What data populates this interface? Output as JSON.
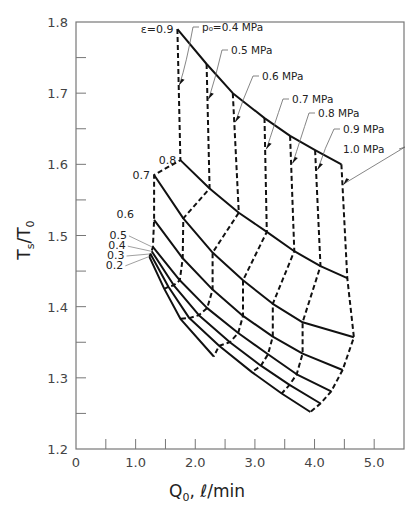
{
  "chart_data": {
    "type": "line",
    "title": "",
    "xlabel": "Q₀, ℓ/min",
    "ylabel": "Tₛ/T₀",
    "xlim": [
      0,
      5.5
    ],
    "ylim": [
      1.2,
      1.8
    ],
    "x_ticks": [
      "0",
      "1.0",
      "2.0",
      "3.0",
      "4.0",
      "5.0"
    ],
    "y_ticks": [
      "1.2",
      "1.3",
      "1.4",
      "1.5",
      "1.6",
      "1.7",
      "1.8"
    ],
    "grid": false,
    "pressure_levels_MPa": [
      0.4,
      0.5,
      0.6,
      0.7,
      0.8,
      0.9,
      1.0
    ],
    "series": [
      {
        "name": "ε=0.9",
        "label": "ε=0.9",
        "points": [
          [
            1.7,
            1.79
          ],
          [
            2.19,
            1.741
          ],
          [
            2.63,
            1.7
          ],
          [
            3.16,
            1.665
          ],
          [
            3.59,
            1.64
          ],
          [
            4.01,
            1.62
          ],
          [
            4.45,
            1.6
          ]
        ]
      },
      {
        "name": "ε=0.8",
        "label": "0.8",
        "points": [
          [
            1.75,
            1.606
          ],
          [
            2.24,
            1.566
          ],
          [
            2.73,
            1.532
          ],
          [
            3.2,
            1.505
          ],
          [
            3.66,
            1.478
          ],
          [
            4.1,
            1.457
          ],
          [
            4.55,
            1.44
          ]
        ]
      },
      {
        "name": "ε=0.7",
        "label": "0.7",
        "points": [
          [
            1.31,
            1.585
          ],
          [
            1.8,
            1.524
          ],
          [
            2.29,
            1.476
          ],
          [
            2.8,
            1.437
          ],
          [
            3.3,
            1.404
          ],
          [
            3.8,
            1.378
          ],
          [
            4.66,
            1.357
          ]
        ]
      },
      {
        "name": "ε=0.6",
        "label": "0.6",
        "points": [
          [
            1.31,
            1.522
          ],
          [
            1.79,
            1.468
          ],
          [
            2.29,
            1.424
          ],
          [
            2.8,
            1.387
          ],
          [
            3.3,
            1.358
          ],
          [
            3.8,
            1.334
          ],
          [
            4.47,
            1.311
          ]
        ]
      },
      {
        "name": "ε=0.5",
        "label": "0.5",
        "points": [
          [
            1.29,
            1.484
          ],
          [
            1.74,
            1.437
          ],
          [
            2.2,
            1.398
          ],
          [
            2.72,
            1.363
          ],
          [
            3.22,
            1.333
          ],
          [
            3.7,
            1.305
          ],
          [
            4.28,
            1.281
          ]
        ]
      },
      {
        "name": "ε=0.4",
        "label": "0.4",
        "points": [
          [
            1.27,
            1.478
          ],
          [
            1.64,
            1.43
          ],
          [
            2.06,
            1.388
          ],
          [
            2.58,
            1.35
          ],
          [
            3.1,
            1.317
          ],
          [
            3.58,
            1.29
          ],
          [
            4.1,
            1.264
          ]
        ]
      },
      {
        "name": "ε=0.3",
        "label": "0.3",
        "points": [
          [
            1.25,
            1.474
          ],
          [
            1.55,
            1.428
          ],
          [
            1.9,
            1.384
          ],
          [
            2.4,
            1.345
          ],
          [
            2.95,
            1.308
          ],
          [
            3.45,
            1.278
          ],
          [
            3.93,
            1.252
          ]
        ]
      },
      {
        "name": "ε=0.2",
        "label": "0.2",
        "points": [
          [
            1.23,
            1.47
          ],
          [
            1.48,
            1.425
          ],
          [
            1.75,
            1.383
          ],
          [
            2.31,
            1.33
          ]
        ]
      }
    ],
    "annotations": [
      {
        "text": "ε=0.9",
        "target": [
          1.7,
          1.79
        ]
      },
      {
        "text": "p₀=0.4 MPa",
        "target": [
          1.72,
          1.712
        ]
      },
      {
        "text": "0.5 MPa",
        "target": [
          2.21,
          1.692
        ]
      },
      {
        "text": "0.6 MPa",
        "target": [
          2.66,
          1.66
        ]
      },
      {
        "text": "0.7 MPa",
        "target": [
          3.18,
          1.622
        ]
      },
      {
        "text": "0.8 MPa",
        "target": [
          3.62,
          1.602
        ]
      },
      {
        "text": "0.9 MPa",
        "target": [
          4.04,
          1.593
        ]
      },
      {
        "text": "1.0 MPa",
        "target": [
          4.48,
          1.572
        ]
      }
    ]
  },
  "axes": {
    "x_title_main": "Q",
    "x_title_sub": "0",
    "x_title_rest": ", ℓ/min",
    "y_title_main": "T",
    "y_title_sub1": "s",
    "y_title_sep": "/T",
    "y_title_sub2": "0"
  }
}
